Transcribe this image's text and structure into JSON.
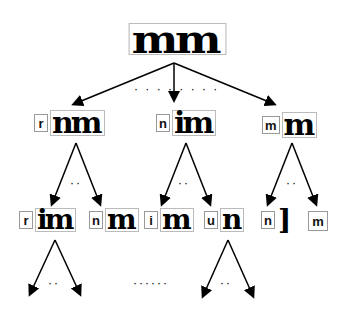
{
  "diagram": {
    "type": "beam-search tree of character recognition",
    "root": {
      "image_text": "mm"
    },
    "level1": [
      {
        "char": "r",
        "residual_text": "nm"
      },
      {
        "char": "n",
        "residual_text": "im"
      },
      {
        "char": "m",
        "residual_text": "m"
      }
    ],
    "level1_gap_dots": "· · · ·   · · · ·",
    "level2": [
      {
        "char": "r",
        "residual_text": "im"
      },
      {
        "char": "n",
        "residual_text": "m"
      },
      {
        "char": "i",
        "residual_text": "m"
      },
      {
        "char": "u",
        "residual_text": "n"
      },
      {
        "char": "n",
        "residual_text": "]"
      },
      {
        "char": "m",
        "residual_text": ""
      }
    ],
    "ellipsis_short": "··",
    "ellipsis_long": "······"
  }
}
